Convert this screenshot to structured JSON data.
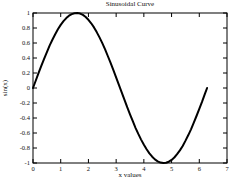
{
  "figure": {
    "background": "#ffffff",
    "text_color": "#111111"
  },
  "chart_data": {
    "type": "line",
    "title": "Sinusoidal Curve",
    "xlabel": "x values",
    "ylabel": "sin(x)",
    "xlim": [
      0,
      7
    ],
    "ylim": [
      -1,
      1
    ],
    "xticks": [
      0,
      1,
      2,
      3,
      4,
      5,
      6,
      7
    ],
    "yticks": [
      -1,
      -0.8,
      -0.6,
      -0.4,
      -0.2,
      0,
      0.2,
      0.4,
      0.6,
      0.8,
      1
    ],
    "grid": false,
    "legend": null,
    "axis_color": "#000000",
    "line_color": "#000000",
    "line_width": 2,
    "series": [
      {
        "name": "sin(x)",
        "x": [
          0,
          0.1,
          0.2,
          0.3,
          0.4,
          0.5,
          0.6,
          0.7,
          0.8,
          0.9,
          1.0,
          1.1,
          1.2,
          1.3,
          1.4,
          1.5,
          1.6,
          1.7,
          1.8,
          1.9,
          2.0,
          2.1,
          2.2,
          2.3,
          2.4,
          2.5,
          2.6,
          2.7,
          2.8,
          2.9,
          3.0,
          3.1,
          3.2,
          3.3,
          3.4,
          3.5,
          3.6,
          3.7,
          3.8,
          3.9,
          4.0,
          4.1,
          4.2,
          4.3,
          4.4,
          4.5,
          4.6,
          4.7,
          4.8,
          4.9,
          5.0,
          5.1,
          5.2,
          5.3,
          5.4,
          5.5,
          5.6,
          5.7,
          5.8,
          5.9,
          6.0,
          6.1,
          6.2,
          6.283
        ],
        "y": [
          0,
          0.1,
          0.199,
          0.296,
          0.389,
          0.479,
          0.565,
          0.644,
          0.717,
          0.783,
          0.841,
          0.891,
          0.932,
          0.964,
          0.985,
          0.997,
          1.0,
          0.992,
          0.974,
          0.947,
          0.909,
          0.863,
          0.808,
          0.746,
          0.675,
          0.599,
          0.516,
          0.427,
          0.335,
          0.239,
          0.141,
          0.042,
          -0.058,
          -0.158,
          -0.256,
          -0.351,
          -0.443,
          -0.53,
          -0.612,
          -0.688,
          -0.757,
          -0.818,
          -0.872,
          -0.916,
          -0.952,
          -0.978,
          -0.994,
          -1.0,
          -0.996,
          -0.982,
          -0.959,
          -0.926,
          -0.883,
          -0.832,
          -0.773,
          -0.706,
          -0.631,
          -0.551,
          -0.465,
          -0.374,
          -0.279,
          -0.182,
          -0.083,
          0
        ]
      }
    ]
  }
}
